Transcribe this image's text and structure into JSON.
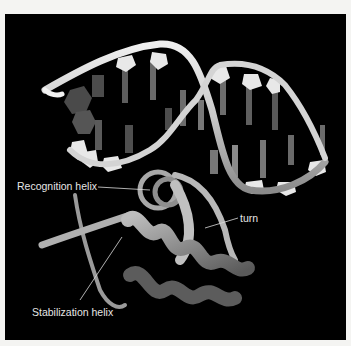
{
  "figure": {
    "background_color": "#000000",
    "frame_color": "#f4f4f2",
    "labels": {
      "recognition_helix": "Recognition helix",
      "turn": "turn",
      "stabilization_helix": "Stabilization helix"
    }
  }
}
